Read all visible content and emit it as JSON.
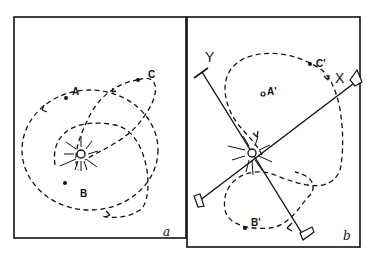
{
  "figure": {
    "panels": [
      {
        "id": "a",
        "label": "a",
        "points": [
          {
            "name": "A",
            "label": "A"
          },
          {
            "name": "B",
            "label": "B"
          },
          {
            "name": "C",
            "label": "C"
          }
        ],
        "description": "Three dashed elliptical orbits around a central radiating sun"
      },
      {
        "id": "b",
        "label": "b",
        "points": [
          {
            "name": "A'",
            "label": "A'"
          },
          {
            "name": "B'",
            "label": "B'"
          },
          {
            "name": "C'",
            "label": "C'"
          }
        ],
        "axes": [
          {
            "name": "X",
            "label": "X"
          },
          {
            "name": "Y",
            "label": "Y"
          }
        ],
        "description": "Rotating X/Y axes through the sun with transformed orbit path"
      }
    ]
  },
  "colors": {
    "ink": "#111111",
    "background": "#ffffff"
  }
}
